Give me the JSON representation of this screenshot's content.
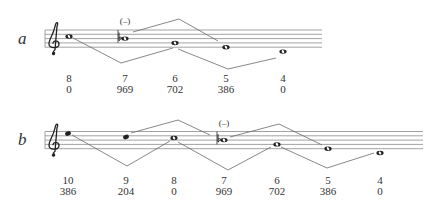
{
  "colors": {
    "staff": "#8a8a8a",
    "line": "#6a6a6a",
    "note": "#222222",
    "text": "#333333"
  },
  "systems": [
    {
      "label": "a",
      "label_pos": [
        18,
        30
      ],
      "staff": {
        "x1": 45,
        "x2": 322,
        "lines_y": [
          30,
          34.3,
          38.6,
          42.9,
          47.2
        ]
      },
      "clef": "treble-clef",
      "notes": [
        {
          "x": 69,
          "y": 36.5,
          "type": "whole",
          "top": "8",
          "bottom": "0"
        },
        {
          "x": 125,
          "y": 38.6,
          "type": "whole",
          "accidental": "flat",
          "marker": "(–)",
          "barline": true,
          "top": "7",
          "bottom": "969"
        },
        {
          "x": 175,
          "y": 43,
          "type": "whole",
          "top": "6",
          "bottom": "702"
        },
        {
          "x": 226,
          "y": 47.3,
          "type": "whole",
          "top": "5",
          "bottom": "386"
        },
        {
          "x": 283,
          "y": 51.6,
          "type": "whole",
          "top": "4",
          "bottom": "0"
        }
      ],
      "zigzags": [
        [
          [
            133,
            32
          ],
          [
            179,
            19
          ],
          [
            218,
            41
          ]
        ],
        [
          [
            73,
            38
          ],
          [
            121,
            63
          ],
          [
            173,
            48
          ]
        ],
        [
          [
            178,
            49
          ],
          [
            228,
            69
          ],
          [
            276,
            58
          ]
        ]
      ],
      "labels_y": [
        73,
        84
      ]
    },
    {
      "label": "b",
      "label_pos": [
        18,
        131
      ],
      "staff": {
        "x1": 45,
        "x2": 423,
        "lines_y": [
          131.5,
          135.8,
          140.1,
          144.4,
          148.7
        ]
      },
      "clef": "treble-clef",
      "notes": [
        {
          "x": 68,
          "y": 133.5,
          "type": "filled",
          "top": "10",
          "bottom": "386"
        },
        {
          "x": 126,
          "y": 137,
          "type": "filled",
          "top": "9",
          "bottom": "204"
        },
        {
          "x": 174,
          "y": 138,
          "type": "whole",
          "top": "8",
          "bottom": "0"
        },
        {
          "x": 224,
          "y": 140.1,
          "type": "whole",
          "accidental": "flat",
          "marker": "(–)",
          "barline": true,
          "top": "7",
          "bottom": "969"
        },
        {
          "x": 277,
          "y": 144.4,
          "type": "whole",
          "top": "6",
          "bottom": "702"
        },
        {
          "x": 328,
          "y": 148.7,
          "type": "whole",
          "top": "5",
          "bottom": "386"
        },
        {
          "x": 380,
          "y": 153,
          "type": "whole",
          "top": "4",
          "bottom": "0"
        }
      ],
      "zigzags": [
        [
          [
            131,
            133
          ],
          [
            178,
            120
          ],
          [
            210,
            135
          ]
        ],
        [
          [
            230,
            137
          ],
          [
            279,
            124
          ],
          [
            322,
            145
          ]
        ],
        [
          [
            72,
            135
          ],
          [
            127,
            166
          ],
          [
            170,
            141
          ]
        ],
        [
          [
            178,
            142
          ],
          [
            228,
            170
          ],
          [
            271,
            147
          ]
        ],
        [
          [
            281,
            147
          ],
          [
            327,
            168
          ],
          [
            374,
            153
          ]
        ]
      ],
      "labels_y": [
        175,
        186
      ]
    }
  ]
}
